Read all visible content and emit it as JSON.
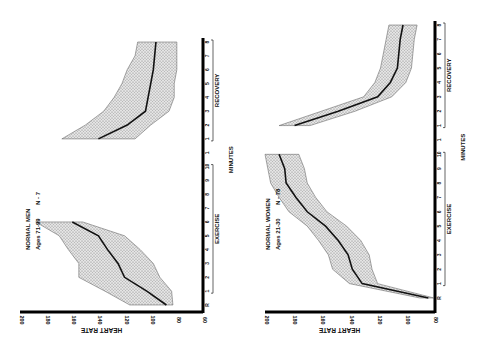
{
  "figure": {
    "orientation": "rotated-90",
    "shared_x_label": "MINUTES",
    "faint_caption": ""
  },
  "chart_data": [
    {
      "type": "line",
      "title": "NORMAL MEN",
      "subtitle": "Ages 71-99",
      "n_label": "N - 7",
      "ylabel": "HEART RATE",
      "xlabel": "MINUTES",
      "ylim": [
        60,
        200
      ],
      "yticks": [
        200,
        180,
        160,
        140,
        120,
        100,
        80,
        60
      ],
      "segments": [
        {
          "name": "EXERCISE",
          "x": [
            "R",
            "1",
            "2",
            "3",
            "4",
            "5",
            "6"
          ],
          "mean": [
            88,
            103,
            120,
            125,
            133,
            140,
            160
          ],
          "upper": [
            116,
            135,
            155,
            155,
            163,
            170,
            188
          ],
          "lower": [
            83,
            84,
            93,
            98,
            108,
            120,
            152
          ]
        },
        {
          "name": "RECOVERY",
          "x": [
            "1",
            "2",
            "3",
            "4",
            "5",
            "6",
            "7",
            "8"
          ],
          "mean": [
            140,
            118,
            104,
            102,
            100,
            98,
            97,
            96
          ],
          "upper": [
            168,
            150,
            136,
            128,
            122,
            118,
            112,
            110
          ],
          "lower": [
            112,
            100,
            86,
            82,
            82,
            80,
            80,
            80
          ]
        }
      ],
      "xticks": [
        "R",
        "1",
        "2",
        "3",
        "4",
        "5",
        "6",
        "7",
        "8",
        "9",
        "10",
        "1",
        "1",
        "2",
        "3",
        "4",
        "5",
        "6",
        "7",
        "8"
      ],
      "grid": false,
      "legend": "none"
    },
    {
      "type": "line",
      "title": "NORMAL WOMEN",
      "subtitle": "Ages 21-30",
      "n_label": "N - 78",
      "ylabel": "HEART RATE",
      "xlabel": "MINUTES",
      "ylim": [
        80,
        200
      ],
      "yticks": [
        200,
        180,
        160,
        140,
        120,
        100,
        80
      ],
      "segments": [
        {
          "name": "EXERCISE",
          "x": [
            "R",
            "1",
            "2",
            "3",
            "4",
            "5",
            "6",
            "7",
            "8",
            "9",
            "10"
          ],
          "mean": [
            84,
            131,
            138,
            141,
            148,
            157,
            170,
            178,
            185,
            186,
            190
          ],
          "upper": [
            90,
            140,
            152,
            155,
            162,
            170,
            183,
            190,
            196,
            198,
            200
          ],
          "lower": [
            80,
            120,
            124,
            126,
            132,
            142,
            156,
            164,
            170,
            172,
            176
          ]
        },
        {
          "name": "RECOVERY",
          "x": [
            "1",
            "2",
            "3",
            "4",
            "5",
            "6",
            "7",
            "8"
          ],
          "mean": [
            179,
            148,
            120,
            111,
            106,
            105,
            104,
            102
          ],
          "upper": [
            190,
            160,
            130,
            122,
            118,
            116,
            114,
            112
          ],
          "lower": [
            168,
            136,
            110,
            100,
            96,
            95,
            94,
            92
          ]
        }
      ],
      "xticks": [
        "R",
        "1",
        "2",
        "3",
        "4",
        "5",
        "6",
        "7",
        "8",
        "9",
        "10",
        "1",
        "1",
        "2",
        "3",
        "4",
        "5",
        "6",
        "7",
        "8"
      ],
      "grid": false,
      "legend": "none"
    }
  ],
  "panels": {
    "men": {
      "title": "NORMAL MEN",
      "subtitle": "Ages 71-99",
      "n_label": "N - 7",
      "ylabel": "HEART RATE",
      "exercise_label": "EXERCISE",
      "recovery_label": "RECOVERY",
      "xlabel": "MINUTES"
    },
    "women": {
      "title": "NORMAL WOMEN",
      "subtitle": "Ages 21-30",
      "n_label": "N - 78",
      "ylabel": "HEART RATE",
      "exercise_label": "EXERCISE",
      "recovery_label": "RECOVERY",
      "xlabel": "MINUTES"
    }
  }
}
